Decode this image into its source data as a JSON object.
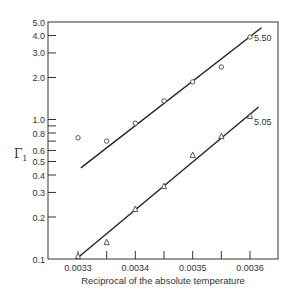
{
  "chart_data": {
    "type": "scatter",
    "title": "",
    "xlabel": "Reciprocal of the absolute temperature",
    "ylabel": "Γ1",
    "ylabel_main": "Γ",
    "ylabel_sub": "1",
    "yscale": "log",
    "xlim": [
      0.003275,
      0.003675
    ],
    "ylim": [
      0.1,
      5.0
    ],
    "grid": false,
    "x_ticks": [
      0.0033,
      0.00335,
      0.0034,
      0.00345,
      0.0035,
      0.00355,
      0.0036
    ],
    "x_tick_labels": [
      "0.0033",
      "0.0034",
      "0.0035",
      "0.0036"
    ],
    "x_tick_label_values": [
      0.0033,
      0.0034,
      0.0035,
      0.0036
    ],
    "y_ticks": [
      0.1,
      0.2,
      0.3,
      0.4,
      0.5,
      0.6,
      0.7,
      0.8,
      0.9,
      1.0,
      2.0,
      3.0,
      4.0,
      5.0
    ],
    "y_tick_labels": [
      {
        "value": 0.1,
        "label": "0.1"
      },
      {
        "value": 0.2,
        "label": "0.2"
      },
      {
        "value": 0.3,
        "label": "0.3"
      },
      {
        "value": 0.4,
        "label": "0.4"
      },
      {
        "value": 0.5,
        "label": "0.5"
      },
      {
        "value": 0.6,
        "label": "0.6"
      },
      {
        "value": 0.8,
        "label": "0.8"
      },
      {
        "value": 1.0,
        "label": "1.0"
      },
      {
        "value": 2.0,
        "label": "2.0"
      },
      {
        "value": 3.0,
        "label": "3.0"
      },
      {
        "value": 4.0,
        "label": "4.0"
      },
      {
        "value": 5.0,
        "label": "5.0"
      }
    ],
    "series": [
      {
        "name": "5.50",
        "marker": "circle",
        "x": [
          0.0033,
          0.00335,
          0.0034,
          0.00345,
          0.0035,
          0.00355,
          0.0036
        ],
        "values": [
          0.74,
          0.7,
          0.94,
          1.36,
          1.86,
          2.38,
          3.9
        ],
        "fit_line": {
          "x": [
            0.003305,
            0.00362
          ],
          "y": [
            0.45,
            4.55
          ]
        }
      },
      {
        "name": "5.05",
        "marker": "triangle",
        "x": [
          0.0033,
          0.00335,
          0.0034,
          0.00345,
          0.0035,
          0.00355,
          0.0036
        ],
        "values": [
          0.105,
          0.132,
          0.228,
          0.333,
          0.557,
          0.76,
          1.06
        ],
        "fit_line": {
          "x": [
            0.003297,
            0.003615
          ],
          "y": [
            0.1,
            1.23
          ]
        }
      }
    ]
  },
  "colors": {
    "axis": "#333333",
    "line": "#222222",
    "marker": "#444444",
    "text": "#333333",
    "background": "#ffffff"
  }
}
